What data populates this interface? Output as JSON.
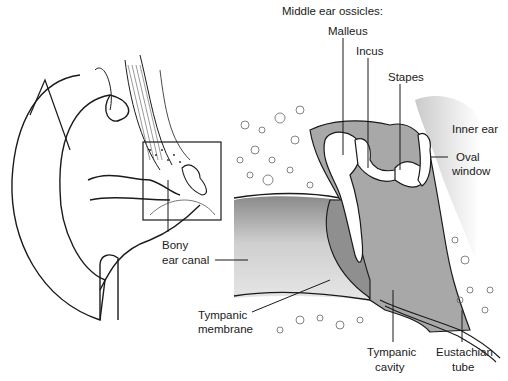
{
  "diagram": {
    "heading": "Middle ear ossicles:",
    "labels": {
      "malleus": "Malleus",
      "incus": "Incus",
      "stapes": "Stapes",
      "inner_ear": "Inner ear",
      "oval_window_1": "Oval",
      "oval_window_2": "window",
      "bony_canal_1": "Bony",
      "bony_canal_2": "ear canal",
      "tympanic_membrane_1": "Tympanic",
      "tympanic_membrane_2": "membrane",
      "tympanic_cavity_1": "Tympanic",
      "tympanic_cavity_2": "cavity",
      "eustachian_1": "Eustachian",
      "eustachian_2": "tube"
    },
    "colors": {
      "line": "#1a1a1a",
      "cavity_grey": "#a8a8a8",
      "canal_grey": "#c4c4c4",
      "bone_white": "#ffffff"
    }
  }
}
